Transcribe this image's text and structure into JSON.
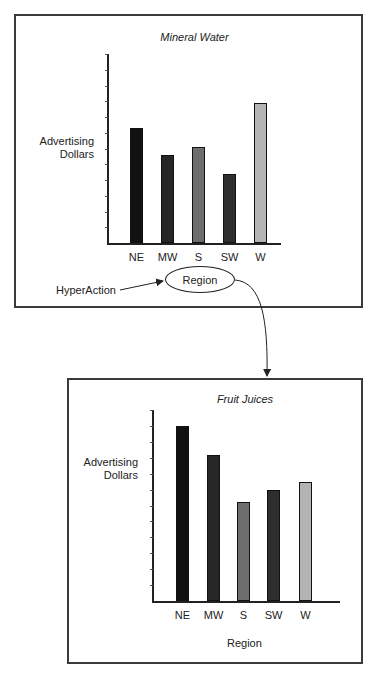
{
  "top_panel": {
    "title": "Mineral Water",
    "ylabel_line1": "Advertising",
    "ylabel_line2": "Dollars",
    "categories": [
      "NE",
      "MW",
      "S",
      "SW",
      "W"
    ],
    "xlabel_button": "Region"
  },
  "hyperaction_label": "HyperAction",
  "bottom_panel": {
    "title": "Fruit Juices",
    "ylabel_line1": "Advertising",
    "ylabel_line2": "Dollars",
    "categories": [
      "NE",
      "MW",
      "S",
      "SW",
      "W"
    ],
    "xlabel": "Region"
  },
  "colors": {
    "NE": "#111111",
    "MW": "#262626",
    "S": "#6e6e6e",
    "SW": "#2e2e2e",
    "W": "#b4b4b4"
  },
  "chart_data": [
    {
      "type": "bar",
      "title": "Mineral Water",
      "xlabel": "Region",
      "ylabel": "Advertising Dollars",
      "categories": [
        "NE",
        "MW",
        "S",
        "SW",
        "W"
      ],
      "values": [
        7.3,
        5.6,
        6.1,
        4.4,
        8.9
      ],
      "ylim": [
        0,
        12
      ],
      "yticks_count": 12,
      "ytick_labels": "none",
      "grid": false,
      "legend": "none"
    },
    {
      "type": "bar",
      "title": "Fruit Juices",
      "xlabel": "Region",
      "ylabel": "Advertising Dollars",
      "categories": [
        "NE",
        "MW",
        "S",
        "SW",
        "W"
      ],
      "values": [
        11.0,
        9.2,
        6.2,
        7.0,
        7.5
      ],
      "ylim": [
        0,
        12
      ],
      "yticks_count": 12,
      "ytick_labels": "none",
      "grid": false,
      "legend": "none"
    }
  ]
}
